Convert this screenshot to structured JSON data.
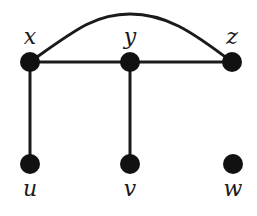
{
  "diagram": {
    "type": "graph",
    "nodes": [
      {
        "id": "x",
        "label": "x",
        "cx": 30,
        "cy": 62,
        "label_x": 30,
        "label_y": 44
      },
      {
        "id": "y",
        "label": "y",
        "cx": 130,
        "cy": 62,
        "label_x": 130,
        "label_y": 44
      },
      {
        "id": "z",
        "label": "z",
        "cx": 232,
        "cy": 62,
        "label_x": 232,
        "label_y": 44
      },
      {
        "id": "u",
        "label": "u",
        "cx": 30,
        "cy": 164,
        "label_x": 30,
        "label_y": 196
      },
      {
        "id": "v",
        "label": "v",
        "cx": 130,
        "cy": 164,
        "label_x": 130,
        "label_y": 196
      },
      {
        "id": "w",
        "label": "w",
        "cx": 233,
        "cy": 164,
        "label_x": 233,
        "label_y": 196
      }
    ],
    "edges": [
      {
        "from": "x",
        "to": "y",
        "shape": "straight"
      },
      {
        "from": "y",
        "to": "z",
        "shape": "straight"
      },
      {
        "from": "x",
        "to": "z",
        "shape": "arc"
      },
      {
        "from": "x",
        "to": "u",
        "shape": "straight"
      },
      {
        "from": "y",
        "to": "v",
        "shape": "straight"
      }
    ],
    "isolated_nodes": [
      "w"
    ],
    "colors": {
      "node": "#111111",
      "edge": "#1a1a1a",
      "background": "#ffffff"
    }
  }
}
